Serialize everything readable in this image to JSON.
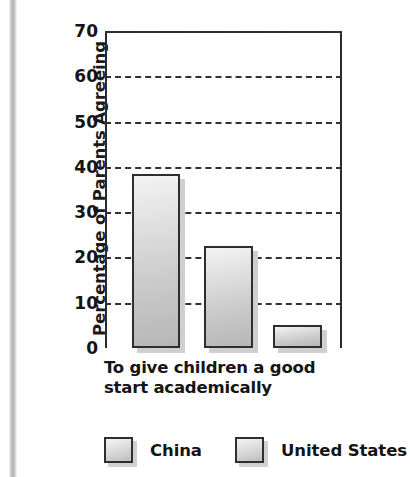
{
  "chart_data": {
    "type": "bar",
    "title": "",
    "xlabel": "To give children a good start academically",
    "ylabel": "Percentage of Parents Agreeing",
    "categories": [
      "To give children a good start academically"
    ],
    "ylim": [
      0,
      70
    ],
    "yticks": [
      70,
      60,
      50,
      40,
      30,
      20,
      10,
      0
    ],
    "grid": true,
    "legend_position": "bottom",
    "series": [
      {
        "name": "China",
        "values": [
          38.5
        ]
      },
      {
        "name": "United States",
        "values": [
          22.5
        ]
      },
      {
        "name": "United States",
        "values": [
          5
        ]
      }
    ],
    "bars": [
      {
        "label": "China",
        "value": 38.5
      },
      {
        "label": "United States",
        "value": 22.5
      },
      {
        "label": "United States",
        "value": 5
      }
    ]
  },
  "axis": {
    "y_title": "Percentage of Parents Agreeing",
    "tick_labels": [
      "70",
      "60",
      "50",
      "40",
      "30",
      "20",
      "10",
      "0"
    ]
  },
  "category_label": {
    "line1": "To give children a good",
    "line2": "start academically"
  },
  "legend": {
    "items": [
      {
        "label": "China",
        "swatch": "legend-swatch-gray"
      },
      {
        "label": "United States",
        "swatch": "legend-swatch-gray"
      }
    ]
  },
  "colors": {
    "bar_fill_light": "#f3f3f3",
    "bar_fill_dark": "#b6b6b6",
    "bar_border": "#2e2e2e",
    "gridline": "#303030",
    "axis": "#2a2a2a",
    "text": "#141414",
    "background": "#ffffff"
  }
}
